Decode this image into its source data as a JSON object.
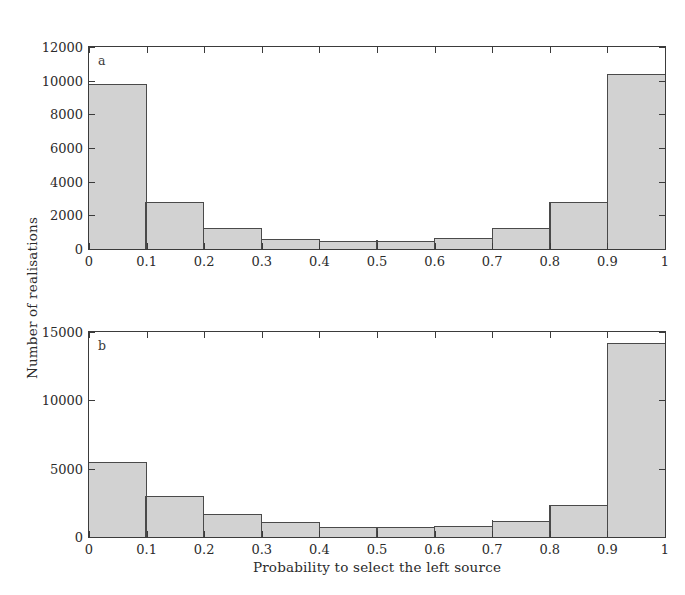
{
  "figure": {
    "ylabel": "Number of realisations",
    "xlabel": "Probability to select the left source",
    "bar_fill": "#d2d2d2",
    "bar_edge": "#4a4a4a",
    "axis_color": "#3b3b3b"
  },
  "panels": [
    {
      "letter": "a"
    },
    {
      "letter": "b"
    }
  ],
  "chart_data": [
    {
      "type": "bar",
      "panel": "a",
      "title": "",
      "xlabel": "Probability to select the left source",
      "ylabel": "Number of realisations",
      "bin_edges": [
        0,
        0.1,
        0.2,
        0.3,
        0.4,
        0.5,
        0.6,
        0.7,
        0.8,
        0.9,
        1.0
      ],
      "categories": [
        "0-0.1",
        "0.1-0.2",
        "0.2-0.3",
        "0.3-0.4",
        "0.4-0.5",
        "0.5-0.6",
        "0.6-0.7",
        "0.7-0.8",
        "0.8-0.9",
        "0.9-1"
      ],
      "values": [
        9800,
        2800,
        1250,
        600,
        500,
        500,
        650,
        1250,
        2800,
        10400
      ],
      "xlim": [
        0,
        1
      ],
      "ylim": [
        0,
        12000
      ],
      "xticks": [
        0,
        0.1,
        0.2,
        0.3,
        0.4,
        0.5,
        0.6,
        0.7,
        0.8,
        0.9,
        1
      ],
      "xticklabels": [
        "0",
        "0.1",
        "0.2",
        "0.3",
        "0.4",
        "0.5",
        "0.6",
        "0.7",
        "0.8",
        "0.9",
        "1"
      ],
      "yticks": [
        0,
        2000,
        4000,
        6000,
        8000,
        10000,
        12000
      ],
      "yticklabels": [
        "0",
        "2000",
        "4000",
        "6000",
        "8000",
        "10000",
        "12000"
      ],
      "grid": false,
      "legend": false
    },
    {
      "type": "bar",
      "panel": "b",
      "title": "",
      "xlabel": "Probability to select the left source",
      "ylabel": "Number of realisations",
      "bin_edges": [
        0,
        0.1,
        0.2,
        0.3,
        0.4,
        0.5,
        0.6,
        0.7,
        0.8,
        0.9,
        1.0
      ],
      "categories": [
        "0-0.1",
        "0.1-0.2",
        "0.2-0.3",
        "0.3-0.4",
        "0.4-0.5",
        "0.5-0.6",
        "0.6-0.7",
        "0.7-0.8",
        "0.8-0.9",
        "0.9-1"
      ],
      "values": [
        5500,
        3000,
        1650,
        1100,
        750,
        700,
        800,
        1200,
        2350,
        14200
      ],
      "xlim": [
        0,
        1
      ],
      "ylim": [
        0,
        15000
      ],
      "xticks": [
        0,
        0.1,
        0.2,
        0.3,
        0.4,
        0.5,
        0.6,
        0.7,
        0.8,
        0.9,
        1
      ],
      "xticklabels": [
        "0",
        "0.1",
        "0.2",
        "0.3",
        "0.4",
        "0.5",
        "0.6",
        "0.7",
        "0.8",
        "0.9",
        "1"
      ],
      "yticks": [
        0,
        5000,
        10000,
        15000
      ],
      "yticklabels": [
        "0",
        "5000",
        "10000",
        "15000"
      ],
      "grid": false,
      "legend": false
    }
  ]
}
